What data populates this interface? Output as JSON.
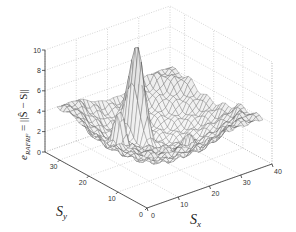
{
  "chart_data": {
    "type": "surface3d",
    "title": "",
    "xlabel": "S_x",
    "ylabel": "S_y",
    "zlabel": "e_RAFRF = ||Ŝ − S||",
    "xlabel_main": "S",
    "xlabel_sub": "x",
    "ylabel_main": "S",
    "ylabel_sub": "y",
    "zlabel_prefix": "e",
    "zlabel_sub": "RAFRF",
    "zlabel_rest": " = ||Ŝ − S||",
    "xlim": [
      0,
      40
    ],
    "ylim": [
      0,
      35
    ],
    "zlim": [
      0,
      10
    ],
    "xticks": [
      "0",
      "10",
      "20",
      "30",
      "40"
    ],
    "yticks": [
      "0",
      "10",
      "20",
      "30"
    ],
    "zticks": [
      "0",
      "2",
      "4",
      "6",
      "8",
      "10"
    ],
    "grid": true,
    "surface": {
      "description": "Wireframe mesh; bowl shape low in the middle, rising toward edges (~4-5), with a sharp spike reaching ~10 near center-back and a secondary ridge of ~6",
      "min_z": 0.3,
      "edge_z": 4.5,
      "peak": {
        "x": 20,
        "y": 25,
        "z": 10
      },
      "secondary_peak": {
        "x": 10,
        "y": 20,
        "z": 6
      }
    }
  }
}
